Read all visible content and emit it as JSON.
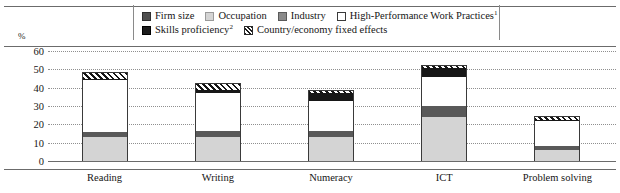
{
  "legend": {
    "rows": [
      [
        {
          "key": "firm",
          "label": "Firm size",
          "sup": "",
          "swatch": "firm-size-swatch",
          "color": "#4f4f4f"
        },
        {
          "key": "occupation",
          "label": "Occupation",
          "sup": "",
          "swatch": "occupation-swatch",
          "color": "#d4d4d4"
        },
        {
          "key": "industry",
          "label": "Industry",
          "sup": "",
          "swatch": "industry-swatch",
          "color": "#8a8a8a"
        },
        {
          "key": "hpwp",
          "label": "High-Performance Work Practices",
          "sup": "1",
          "swatch": "hpwp-swatch",
          "color": "#ffffff"
        }
      ],
      [
        {
          "key": "skills",
          "label": "Skills proficiency",
          "sup": "2",
          "swatch": "skills-proficiency-swatch",
          "color": "#1c1c1c"
        },
        {
          "key": "country",
          "label": "Country/economy fixed effects",
          "sup": "",
          "swatch": "country-fixed-effects-swatch",
          "color": "hatched"
        }
      ]
    ]
  },
  "axis": {
    "unit": "%",
    "y_ticks": [
      "60",
      "50",
      "40",
      "30",
      "20",
      "10",
      "0"
    ]
  },
  "chart_data": {
    "type": "bar",
    "subtype": "stacked",
    "title": "",
    "xlabel": "",
    "ylabel": "%",
    "ylim": [
      0,
      60
    ],
    "ytick_step": 10,
    "grid": true,
    "legend_position": "top",
    "categories": [
      "Reading",
      "Writing",
      "Numeracy",
      "ICT",
      "Problem solving"
    ],
    "series": [
      {
        "name": "Occupation",
        "color": "#d4d4d4",
        "values": [
          13.0,
          13.0,
          13.0,
          24.0,
          6.0
        ]
      },
      {
        "name": "Firm size",
        "color": "#595959",
        "values": [
          3.0,
          3.5,
          3.5,
          6.0,
          2.0
        ]
      },
      {
        "name": "High-Performance Work Practices",
        "color": "#ffffff",
        "values": [
          28.0,
          20.5,
          16.5,
          16.0,
          14.0
        ]
      },
      {
        "name": "Skills proficiency",
        "color": "#171717",
        "values": [
          1.0,
          2.0,
          4.0,
          5.0,
          0.5
        ]
      },
      {
        "name": "Country/economy fixed effects",
        "color": "hatched",
        "values": [
          3.0,
          3.0,
          1.0,
          1.0,
          1.5
        ]
      }
    ],
    "totals": [
      48.0,
      42.0,
      38.0,
      52.0,
      24.0
    ]
  }
}
